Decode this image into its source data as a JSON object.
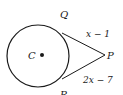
{
  "figure": {
    "type": "geometry-tangent-segments",
    "circle": {
      "center_label": "C",
      "cx": 38,
      "cy": 56,
      "r": 31
    },
    "points": {
      "center": {
        "label": "C",
        "x": 41,
        "y": 55
      },
      "external": {
        "label": "P",
        "x": 105,
        "y": 55
      },
      "tangent_top": {
        "label": "Q",
        "x": 62,
        "y": 33
      },
      "tangent_bottom": {
        "label": "R",
        "x": 62,
        "y": 79
      }
    },
    "segments": {
      "QP": {
        "label": "x − 1"
      },
      "RP": {
        "label": "2x − 7"
      }
    },
    "colors": {
      "stroke": "#1a1a1a",
      "background": "#ffffff"
    }
  }
}
